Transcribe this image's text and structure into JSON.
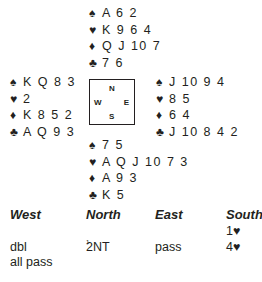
{
  "deal": {
    "north": {
      "spades": "A 6 2",
      "hearts": "K 9 6 4",
      "diamonds": "Q J 10 7",
      "clubs": "7 6"
    },
    "west": {
      "spades": "K Q 8 3",
      "hearts": "2",
      "diamonds": "K 8 5 2",
      "clubs": "A Q 9 3"
    },
    "east": {
      "spades": "J 10 9 4",
      "hearts": "8 5",
      "diamonds": "6 4",
      "clubs": "J 10 8 4 2"
    },
    "south": {
      "spades": "7 5",
      "hearts": "A Q J 10 7 3",
      "diamonds": "A 9 3",
      "clubs": "K 5"
    }
  },
  "suits": {
    "spades": "♠",
    "hearts": "♥",
    "diamonds": "♦",
    "clubs": "♣"
  },
  "compass": {
    "n": "N",
    "w": "W",
    "e": "E",
    "s": "S"
  },
  "auction": {
    "headers": [
      "West",
      "North",
      "East",
      "South"
    ],
    "rows": [
      [
        "",
        "",
        "",
        "1♥"
      ],
      [
        "dbl",
        "2NT",
        "pass",
        "4♥"
      ],
      [
        "all pass",
        "",
        "",
        ""
      ]
    ],
    "footnote_marker": "1"
  }
}
